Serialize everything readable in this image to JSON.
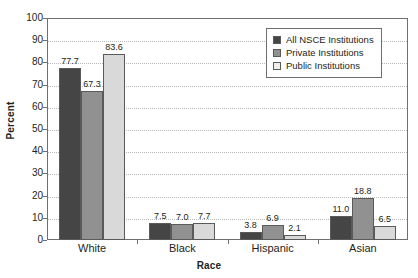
{
  "chart_data": {
    "type": "bar",
    "title": "",
    "xlabel": "Race",
    "ylabel": "Percent",
    "categories": [
      "White",
      "Black",
      "Hispanic",
      "Asian"
    ],
    "series": [
      {
        "name": "All NSCE Institutions",
        "color": "#454545",
        "values": [
          77.7,
          7.5,
          3.8,
          11.0
        ]
      },
      {
        "name": "Private Institutions",
        "color": "#919191",
        "values": [
          67.3,
          7.0,
          6.9,
          18.8
        ]
      },
      {
        "name": "Public Institutions",
        "color": "#d9d9d9",
        "values": [
          83.6,
          7.7,
          2.1,
          6.5
        ]
      }
    ],
    "ylim": [
      0,
      100
    ],
    "yticks": [
      0,
      10,
      20,
      30,
      40,
      50,
      60,
      70,
      80,
      90,
      100
    ],
    "ytick_labels": [
      "0",
      "10",
      "20",
      "30",
      "40",
      "50",
      "60",
      "70",
      "80",
      "90",
      "100"
    ],
    "grid": true,
    "legend_position": "top-right",
    "data_labels": [
      "77.7",
      "67.3",
      "83.6",
      "7.5",
      "7.0",
      "7.7",
      "3.8",
      "6.9",
      "2.1",
      "11.0",
      "18.8",
      "6.5"
    ]
  },
  "legend": {
    "items": [
      {
        "label": "All NSCE Institutions"
      },
      {
        "label": "Private Institutions"
      },
      {
        "label": "Public Institutions"
      }
    ]
  }
}
